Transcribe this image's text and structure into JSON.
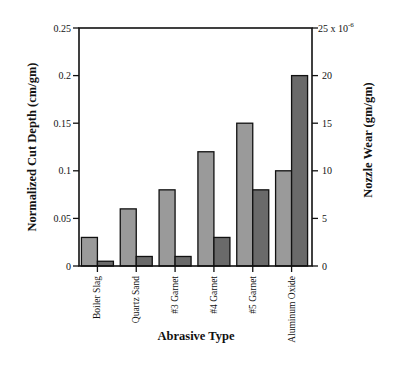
{
  "chart_data": {
    "type": "bar",
    "title": "",
    "xlabel": "Abrasive Type",
    "ylabel": "Normalized Cut Depth (cm/gm)",
    "y2label": "Nozzle Wear (gm/gm)",
    "y2_multiplier_label": "25 x 10",
    "y2_multiplier_exp": "-6",
    "categories": [
      "Boiler Slag",
      "Quartz Sand",
      "#3 Garnet",
      "#4 Garnet",
      "#5 Garnet",
      "Aluminum Oxide"
    ],
    "series": [
      {
        "name": "Normalized Cut Depth",
        "axis": "left",
        "color": "#9a9a9a",
        "values": [
          0.03,
          0.06,
          0.08,
          0.12,
          0.15,
          0.1
        ]
      },
      {
        "name": "Nozzle Wear",
        "axis": "right",
        "color": "#6a6a6a",
        "values": [
          0.5,
          1,
          1,
          3,
          8,
          20
        ]
      }
    ],
    "ylim": [
      0,
      0.25
    ],
    "y2lim": [
      0,
      25
    ],
    "yticks": [
      "0",
      "0.05",
      "0.1",
      "0.15",
      "0.2",
      "0.25"
    ],
    "y2ticks": [
      "0",
      "5",
      "10",
      "15",
      "20"
    ],
    "grid": false,
    "legend": "none"
  }
}
